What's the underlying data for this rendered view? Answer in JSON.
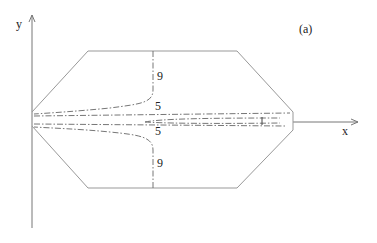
{
  "diagram": {
    "panel_label": "(a)",
    "axes": {
      "x_label": "x",
      "y_label": "y"
    },
    "contour_labels": {
      "upper_outer": "9",
      "upper_inner": "5",
      "lower_inner": "5",
      "lower_outer": "9",
      "center": "1"
    },
    "shape": "hexagonal domain",
    "line_style": "dash-dot contours"
  }
}
